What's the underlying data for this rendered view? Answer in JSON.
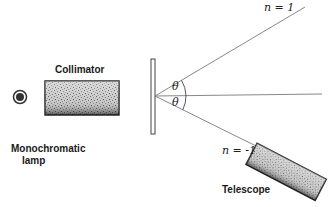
{
  "diagram": {
    "type": "diffraction grating spectrometer",
    "labels": {
      "collimator": "Collimator",
      "lamp_line1": "Monochromatic",
      "lamp_line2": "lamp",
      "telescope": "Telescope",
      "order_plus": "n = 1",
      "order_minus": "n = -1",
      "theta_upper": "θ",
      "theta_lower": "θ"
    },
    "colors": {
      "line": "#707070",
      "body_dark": "#2a2a2a",
      "body_light": "#bdbdbd",
      "text": "#1a1a1a"
    }
  }
}
